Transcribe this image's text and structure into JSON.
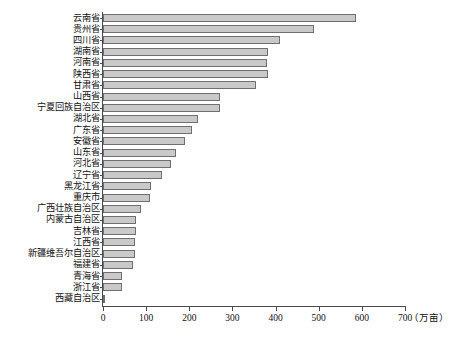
{
  "chart_data": {
    "type": "bar",
    "orientation": "horizontal",
    "title": "",
    "xlabel": "万亩",
    "ylabel": "",
    "xlim": [
      0,
      700
    ],
    "xticks": [
      0,
      100,
      200,
      300,
      400,
      500,
      600,
      700
    ],
    "xtick_labels": [
      "0",
      "100",
      "200",
      "300",
      "400",
      "500",
      "600",
      "700"
    ],
    "unit_label": "（万亩）",
    "grid": false,
    "legend": false,
    "bar_fill_color": "#c9c9c9",
    "bar_border_color": "#6f6f6f",
    "axis_color": "#4a4a4a",
    "categories": [
      "云南省",
      "贵州省",
      "四川省",
      "湖南省",
      "河南省",
      "陕西省",
      "甘肃省",
      "山西省",
      "宁夏回族自治区",
      "湖北省",
      "广东省",
      "安徽省",
      "山东省",
      "河北省",
      "辽宁省",
      "黑龙江省",
      "重庆市",
      "广西壮族自治区",
      "内蒙古自治区",
      "吉林省",
      "江西省",
      "新疆维吾尔自治区",
      "福建省",
      "青海省",
      "浙江省",
      "西藏自治区"
    ],
    "values": [
      586,
      489,
      410,
      383,
      380,
      383,
      355,
      272,
      271,
      220,
      206,
      190,
      169,
      158,
      137,
      112,
      110,
      88,
      77,
      77,
      74,
      74,
      70,
      44,
      44,
      2
    ]
  }
}
